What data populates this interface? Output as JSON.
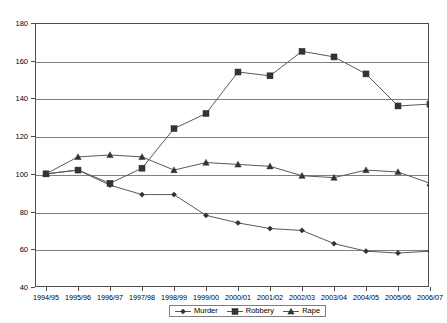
{
  "chart_data": {
    "type": "line",
    "title": "",
    "subtitle": "",
    "xlabel": "",
    "ylabel": "",
    "categories": [
      "1994/95",
      "1995/96",
      "1996/97",
      "1997/98",
      "1998/99",
      "1999/00",
      "2000/01",
      "2001/02",
      "2002/03",
      "2003/04",
      "2004/05",
      "2005/06",
      "2006/07"
    ],
    "ylim": [
      40,
      180
    ],
    "ytick_step": 20,
    "yticks": [
      180,
      160,
      140,
      120,
      100,
      80,
      60,
      40
    ],
    "grid": true,
    "legend_position": "bottom",
    "series": [
      {
        "name": "Murder",
        "marker": "diamond",
        "values": [
          100,
          102,
          94,
          89,
          89,
          78,
          74,
          71,
          70,
          63,
          59,
          58,
          59
        ]
      },
      {
        "name": "Robbery",
        "marker": "square",
        "values": [
          100,
          102,
          95,
          103,
          124,
          132,
          154,
          152,
          165,
          162,
          153,
          136,
          137
        ]
      },
      {
        "name": "Rape",
        "marker": "triangle",
        "values": [
          100,
          109,
          110,
          109,
          102,
          106,
          105,
          104,
          99,
          98,
          102,
          101,
          95
        ]
      }
    ]
  },
  "legend": {
    "items": [
      {
        "label": "Murder"
      },
      {
        "label": "Robbery"
      },
      {
        "label": "Rape"
      }
    ]
  }
}
